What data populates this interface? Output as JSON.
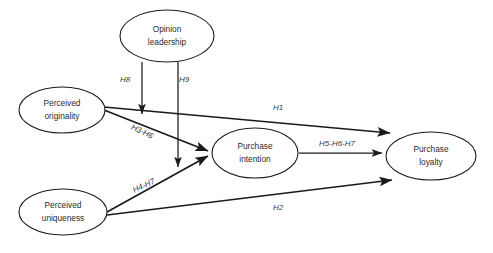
{
  "diagram": {
    "type": "path-model",
    "background_color": "#ffffff",
    "line_color": "#1a1a1a",
    "text_color": "#2b2b2b",
    "nodes": [
      {
        "id": "opinion-leadership",
        "line1": "Opinion",
        "line2": "leadership",
        "cx": 167,
        "cy": 36,
        "rx": 47,
        "ry": 26
      },
      {
        "id": "perceived-originality",
        "line1": "Perceived",
        "line2": "originality",
        "cx": 62,
        "cy": 110,
        "rx": 43,
        "ry": 23
      },
      {
        "id": "perceived-uniqueness",
        "line1": "Perceived",
        "line2": "uniqueness",
        "cx": 63,
        "cy": 212,
        "rx": 44,
        "ry": 23
      },
      {
        "id": "purchase-intention",
        "line1": "Purchase",
        "line2": "intention",
        "cx": 255,
        "cy": 153,
        "rx": 43,
        "ry": 25
      },
      {
        "id": "purchase-loyalty",
        "line1": "Purchase",
        "line2": "loyalty",
        "cx": 431,
        "cy": 156,
        "rx": 45,
        "ry": 24
      }
    ],
    "paths": [
      {
        "id": "h8",
        "label": "H8",
        "from": "opinion-leadership",
        "to": "originality-to-intention-path",
        "label_x": 125,
        "label_y": 80,
        "label_rotation": 0
      },
      {
        "id": "h9",
        "label": "H9",
        "from": "opinion-leadership",
        "to": "uniqueness-to-intention-path",
        "label_x": 184,
        "label_y": 80,
        "label_rotation": 0
      },
      {
        "id": "h1",
        "label": "H1",
        "from": "perceived-originality",
        "to": "purchase-loyalty",
        "label_x": 278,
        "label_y": 108,
        "label_rotation": 0
      },
      {
        "id": "h3-h6",
        "label": "H3-H6",
        "from": "perceived-originality",
        "to": "purchase-intention",
        "label_x": 142,
        "label_y": 132,
        "label_rotation": 25
      },
      {
        "id": "h4-h7",
        "label": "H4-H7",
        "from": "perceived-uniqueness",
        "to": "purchase-intention",
        "label_x": 144,
        "label_y": 186,
        "label_rotation": -24
      },
      {
        "id": "h2",
        "label": "H2",
        "from": "perceived-uniqueness",
        "to": "purchase-loyalty",
        "label_x": 278,
        "label_y": 208,
        "label_rotation": 0
      },
      {
        "id": "h5-h6-h7",
        "label": "H5-H6-H7",
        "from": "purchase-intention",
        "to": "purchase-loyalty",
        "label_x": 337,
        "label_y": 144,
        "label_rotation": 0
      }
    ]
  }
}
